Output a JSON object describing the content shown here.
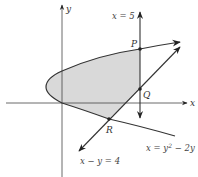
{
  "diagram": {
    "axes": {
      "x_label": "x",
      "y_label": "y"
    },
    "curves": [
      {
        "name": "parabola",
        "equation": "x = y² − 2y",
        "label_main": "x = y",
        "label_sup": "2",
        "label_tail": " − 2y"
      },
      {
        "name": "line",
        "equation": "x − y = 4",
        "label": "x − y = 4"
      },
      {
        "name": "vertical-line",
        "equation": "x = 5",
        "label": "x = 5"
      }
    ],
    "points": [
      {
        "name": "P",
        "label": "P"
      },
      {
        "name": "Q",
        "label": "Q"
      },
      {
        "name": "R",
        "label": "R"
      }
    ],
    "colors": {
      "stroke": "#333333",
      "fill": "#d9d9d9"
    }
  }
}
